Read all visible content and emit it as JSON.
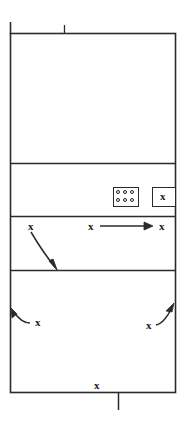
{
  "diagram": {
    "title": "Volleyball court rotation diagram",
    "type": "court-diagram",
    "colors": {
      "line": "#2b2b2b",
      "mark": "#1a1a1a",
      "background": "#ffffff"
    },
    "court": {
      "left": 10,
      "right": 176,
      "top": 33,
      "bottom": 393,
      "divider_rows": [
        163,
        216,
        270
      ]
    },
    "top_ticks": [
      {
        "name": "left-post-tick",
        "x": 10,
        "y_top": 22,
        "y_bottom": 33
      },
      {
        "name": "center-post-tick",
        "x": 64,
        "y_top": 25,
        "y_bottom": 33
      }
    ],
    "bottom_ticks": [
      {
        "name": "bottom-post-tick",
        "x": 118,
        "y_top": 393,
        "y_bottom": 410
      }
    ],
    "zones": [
      {
        "name": "zone-back",
        "label": "",
        "top": 33,
        "bottom": 163
      },
      {
        "name": "zone-bench",
        "label": "",
        "top": 163,
        "bottom": 216
      },
      {
        "name": "zone-attack",
        "label": "",
        "top": 216,
        "bottom": 270
      },
      {
        "name": "zone-front",
        "label": "",
        "top": 270,
        "bottom": 393
      }
    ],
    "sub_boxes": [
      {
        "name": "ball-cart-box",
        "x": 113,
        "y": 187,
        "width": 26,
        "height": 20,
        "content": "dots"
      },
      {
        "name": "server-box",
        "x": 152,
        "y": 187,
        "width": 24,
        "height": 20,
        "content": "x"
      }
    ],
    "dot_grid": {
      "name": "ball-dots",
      "rows": 2,
      "cols": 3,
      "count": 6
    },
    "players": [
      {
        "name": "player-server-box",
        "label": "x",
        "x": 160,
        "y": 191
      },
      {
        "name": "player-attack-left",
        "label": "x",
        "x": 28,
        "y": 221
      },
      {
        "name": "player-attack-mid",
        "label": "x",
        "x": 88,
        "y": 221
      },
      {
        "name": "player-attack-right",
        "label": "x",
        "x": 159,
        "y": 221
      },
      {
        "name": "player-front-left",
        "label": "x",
        "x": 35,
        "y": 317
      },
      {
        "name": "player-front-right",
        "label": "x",
        "x": 146,
        "y": 320
      },
      {
        "name": "player-baseline",
        "label": "x",
        "x": 94,
        "y": 380
      }
    ],
    "arrows": [
      {
        "name": "arrow-attack-left-down",
        "kind": "curved",
        "from": [
          33,
          233
        ],
        "to": [
          57,
          269
        ]
      },
      {
        "name": "arrow-attack-mid-right",
        "kind": "straight",
        "from": [
          100,
          226
        ],
        "to": [
          152,
          226
        ]
      },
      {
        "name": "arrow-front-left-out",
        "kind": "curved",
        "from": [
          30,
          322
        ],
        "to": [
          11,
          310
        ]
      },
      {
        "name": "arrow-front-right-out",
        "kind": "curved",
        "from": [
          155,
          324
        ],
        "to": [
          174,
          304
        ]
      }
    ]
  }
}
